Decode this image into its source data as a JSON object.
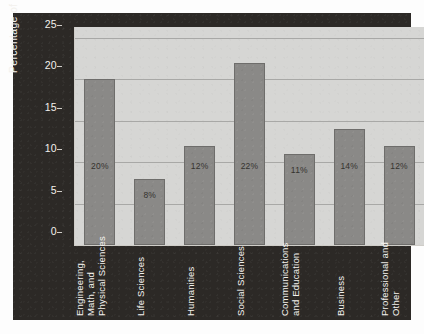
{
  "chart_data": {
    "type": "bar",
    "title": "",
    "subtitle": "",
    "xlabel": "",
    "ylabel": "Percentage of Graduates",
    "ylim": [
      0,
      25
    ],
    "yticks": [
      0,
      5,
      10,
      15,
      20,
      25
    ],
    "ytick_labels": [
      "0",
      "5",
      "10",
      "15",
      "20",
      "25"
    ],
    "grid": true,
    "legend": null,
    "categories": [
      "Engineering,\nMath, and\nPhysical Sciences",
      "Life Sciences",
      "Humanities",
      "Social Sciences",
      "Communications\nand Education",
      "Business",
      "Professional and\nOther"
    ],
    "values": [
      20,
      8,
      12,
      22,
      11,
      14,
      12
    ],
    "data_labels": [
      "20%",
      "8%",
      "12%",
      "22%",
      "11%",
      "14%",
      "12%"
    ],
    "colors": {
      "bar_fill": "#8a8987",
      "bar_edge": "#6e6d6b",
      "plot_background": "#d6d6d4",
      "panel_background": "#2c2926",
      "gridline": "#a8a8a6",
      "axis_text": "#f3f1ed",
      "data_label_text": "#35332f",
      "page_background": "#ffffff"
    }
  }
}
